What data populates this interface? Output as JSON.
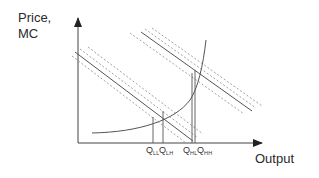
{
  "diagram": {
    "y_axis_label_line1": "Price,",
    "y_axis_label_line2": "MC",
    "x_axis_label": "Output",
    "quantity_labels": [
      {
        "main": "Q",
        "sub": "LL"
      },
      {
        "main": "Q",
        "sub": "LH"
      },
      {
        "main": "Q",
        "sub": "HL"
      },
      {
        "main": "Q",
        "sub": "HH"
      }
    ],
    "curves": [
      {
        "name": "marginal cost curve",
        "style": "solid",
        "shape": "convex rising"
      },
      {
        "name": "low demand/price line",
        "style": "solid",
        "bands": "dashed"
      },
      {
        "name": "high demand/price line",
        "style": "solid",
        "bands": "dashed"
      }
    ],
    "colors": {
      "line": "#555555",
      "dashed": "#8a8a8a",
      "text": "#2a2a2a"
    }
  }
}
